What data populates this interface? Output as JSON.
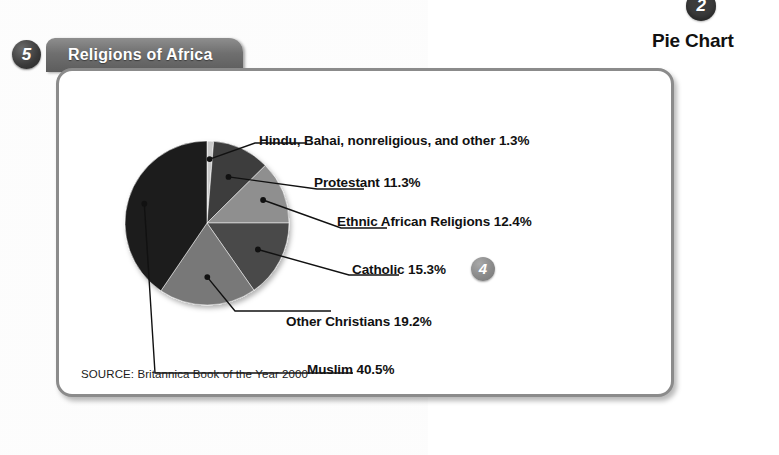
{
  "callout": {
    "top_badge_number": "2",
    "caption": "Pie Chart",
    "section_badge_number": "5",
    "inline_badge_number": "4"
  },
  "panel": {
    "title": "Religions of Africa",
    "source": "SOURCE: Britannica Book of the Year 2000"
  },
  "chart_data": {
    "type": "pie",
    "title": "Religions of Africa",
    "subtitle": "",
    "xlabel": "",
    "ylabel": "",
    "source": "SOURCE: Britannica Book of the Year 2000",
    "legend_position": "callout-labels",
    "grid": false,
    "units": "percent",
    "total": 100.0,
    "categories": [
      "Hindu, Bahai, nonreligious, and other",
      "Protestant",
      "Ethnic African Religions",
      "Catholic",
      "Other Christians",
      "Muslim"
    ],
    "values": [
      1.3,
      11.3,
      12.4,
      15.3,
      19.2,
      40.5
    ],
    "labels": [
      "Hindu, Bahai, nonreligious, and other 1.3%",
      "Protestant 11.3%",
      "Ethnic African Religions 12.4%",
      "Catholic 15.3%",
      "Other Christians 19.2%",
      "Muslim 40.5%"
    ],
    "colors": [
      "#c9c9c9",
      "#3c3c3c",
      "#8f8f8f",
      "#4a4a4a",
      "#787878",
      "#1d1d1d"
    ],
    "slices": [
      {
        "name": "Hindu, Bahai, nonreligious, and other",
        "value": 1.3,
        "label": "Hindu, Bahai, nonreligious, and other 1.3%",
        "color": "#c9c9c9"
      },
      {
        "name": "Protestant",
        "value": 11.3,
        "label": "Protestant 11.3%",
        "color": "#3c3c3c"
      },
      {
        "name": "Ethnic African Religions",
        "value": 12.4,
        "label": "Ethnic African Religions 12.4%",
        "color": "#8f8f8f"
      },
      {
        "name": "Catholic",
        "value": 15.3,
        "label": "Catholic 15.3%",
        "color": "#4a4a4a"
      },
      {
        "name": "Other Christians",
        "value": 19.2,
        "label": "Other Christians 19.2%",
        "color": "#787878"
      },
      {
        "name": "Muslim",
        "value": 40.5,
        "label": "Muslim 40.5%",
        "color": "#1d1d1d"
      }
    ]
  }
}
